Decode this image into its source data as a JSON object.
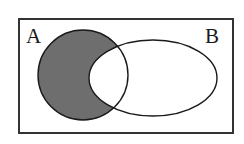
{
  "figure": {
    "background_color": "#ffffff",
    "width": 244,
    "height": 144
  },
  "universe": {
    "name": "universal-set-rectangle",
    "stroke_color": "#333333",
    "stroke_width": 2,
    "fill_color": "#ffffff",
    "x": 18,
    "y": 18,
    "width": 216,
    "height": 116
  },
  "sets": [
    {
      "id": "A",
      "label": "A",
      "shape": "circle",
      "cx": 83,
      "cy": 75,
      "rx": 45,
      "ry": 45,
      "stroke_color": "#1a1a1a",
      "stroke_width": 1.4,
      "label_x": 26,
      "label_y": 26
    },
    {
      "id": "B",
      "label": "B",
      "shape": "ellipse",
      "cx": 153,
      "cy": 78,
      "rx": 64,
      "ry": 38,
      "stroke_color": "#1a1a1a",
      "stroke_width": 1.4,
      "label_x": 205,
      "label_y": 26
    }
  ],
  "shading": {
    "region_name": "A-minus-B",
    "description": "Region inside set A and outside set B is shaded",
    "fill_color": "#6e6e6e",
    "fill_opacity": 1
  },
  "chart_data": {
    "type": "diagram",
    "subtype": "venn",
    "title": "",
    "sets": [
      "A",
      "B"
    ],
    "shaded_regions": [
      "A only"
    ],
    "unshaded_regions": [
      "A and B",
      "B only",
      "outside A and B"
    ],
    "legend": [],
    "annotations": [
      "A",
      "B"
    ]
  }
}
